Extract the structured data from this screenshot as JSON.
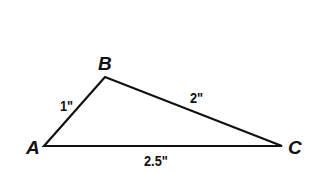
{
  "diagram": {
    "type": "triangle",
    "line_color": "#111111",
    "vertices": [
      {
        "name": "A",
        "x": 44,
        "y": 146
      },
      {
        "name": "B",
        "x": 105,
        "y": 77
      },
      {
        "name": "C",
        "x": 282,
        "y": 146
      }
    ],
    "sides": [
      {
        "between": "AB",
        "label": "1\""
      },
      {
        "between": "BC",
        "label": "2\""
      },
      {
        "between": "AC",
        "label": "2.5\""
      }
    ]
  }
}
